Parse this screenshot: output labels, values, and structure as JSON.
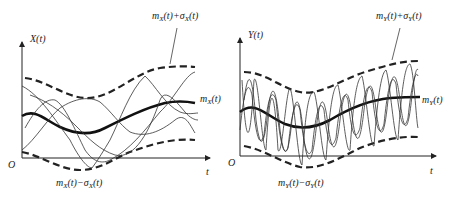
{
  "left_panel": {
    "y_axis_label": "X(t)",
    "x_axis_label": "t",
    "origin_label": "O",
    "mean_label": {
      "m": "m",
      "sub": "X",
      "rest": "(t)"
    },
    "upper_label": {
      "text": "m",
      "sub1": "X",
      "mid": "(t)+σ",
      "sub2": "X",
      "end": "(t)"
    },
    "lower_label": {
      "text": "m",
      "sub1": "X",
      "mid": "(t)−σ",
      "sub2": "X",
      "end": "(t)"
    }
  },
  "right_panel": {
    "y_axis_label": "Y(t)",
    "x_axis_label": "t",
    "origin_label": "O",
    "mean_label": {
      "m": "m",
      "sub": "Y",
      "rest": "(t)"
    },
    "upper_label": {
      "text": "m",
      "sub1": "Y",
      "mid": "(t)+σ",
      "sub2": "Y",
      "end": "(t)"
    },
    "lower_label": {
      "text": "m",
      "sub1": "Y",
      "mid": "(t)−σ",
      "sub2": "Y",
      "end": "(t)"
    }
  },
  "colors": {
    "line": "#222222",
    "background": "#ffffff"
  }
}
